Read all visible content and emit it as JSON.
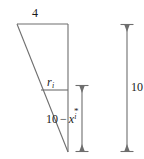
{
  "figure": {
    "stroke_color": "#6e6e6e",
    "text_color": "#1a1a1a",
    "background_color": "#ffffff",
    "labels": {
      "top_width": "4",
      "radius_var": "r",
      "radius_sub": "i",
      "segment_prefix": "10",
      "segment_minus": "−",
      "segment_var": "x",
      "segment_sup": "*",
      "segment_sub": "i",
      "total_height": "10"
    },
    "geometry": {
      "triangle_top_left": [
        17,
        24
      ],
      "triangle_top_right": [
        68,
        24
      ],
      "triangle_bottom": [
        68,
        152
      ],
      "radius_line_y": 90,
      "radius_line_x_start": 41,
      "radius_line_x_end": 68,
      "segment_dim_x": 82,
      "segment_dim_top": 85,
      "segment_dim_bottom": 152,
      "height_dim_x": 127,
      "height_dim_top": 24,
      "height_dim_bottom": 152
    }
  }
}
